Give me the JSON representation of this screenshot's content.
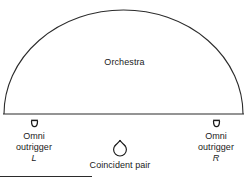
{
  "figure": {
    "name": "Orchestra microphone placement diagram",
    "background_color": "#ffffff",
    "line_color": "#2b2b2b",
    "text_color": "#1a1a1a"
  },
  "stage": {
    "label": "Orchestra",
    "shape": "semicircular arc over a straight baseline",
    "baseline_y": 114,
    "apex_y": 9,
    "left_x": 4,
    "right_x": 243
  },
  "mics": {
    "left": {
      "icon": "omni-microphone-icon",
      "line1": "Omni",
      "line2": "outrigger",
      "channel": "L"
    },
    "center": {
      "icon": "coincident-pair-microphone-icon",
      "line1": "Coincident pair",
      "line2": "",
      "channel": ""
    },
    "right": {
      "icon": "omni-microphone-icon",
      "line1": "Omni",
      "line2": "outrigger",
      "channel": "R"
    }
  },
  "footer": {
    "rule_width_px": 92
  }
}
